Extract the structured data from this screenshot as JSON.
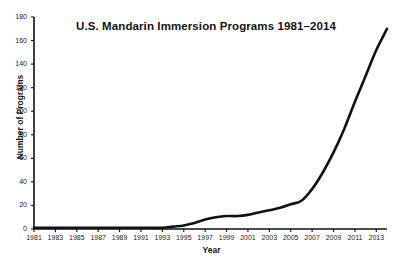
{
  "chart_data": {
    "type": "line",
    "title": "U.S. Mandarin Immersion Programs 1981–2014",
    "xlabel": "Year",
    "ylabel": "Number of Programs",
    "xlim": [
      1981,
      2014
    ],
    "ylim": [
      0,
      180
    ],
    "grid": false,
    "legend": null,
    "line_color": "#111111",
    "x_ticks": [
      1981,
      1983,
      1985,
      1987,
      1989,
      1991,
      1993,
      1995,
      1997,
      1999,
      2001,
      2003,
      2005,
      2007,
      2009,
      2011,
      2013
    ],
    "y_ticks": [
      0,
      20,
      40,
      60,
      80,
      100,
      120,
      140,
      160,
      180
    ],
    "x": [
      1981,
      1982,
      1983,
      1984,
      1985,
      1986,
      1987,
      1988,
      1989,
      1990,
      1991,
      1992,
      1993,
      1994,
      1995,
      1996,
      1997,
      1998,
      1999,
      2000,
      2001,
      2002,
      2003,
      2004,
      2005,
      2006,
      2007,
      2008,
      2009,
      2010,
      2011,
      2012,
      2013,
      2014
    ],
    "values": [
      1,
      1,
      1,
      1,
      1,
      1,
      1,
      1,
      1,
      1,
      1,
      1,
      1,
      2,
      3,
      5,
      8,
      10,
      11,
      11,
      12,
      14,
      16,
      18,
      21,
      24,
      34,
      48,
      65,
      85,
      108,
      130,
      152,
      170
    ],
    "series": [
      {
        "name": "U.S. Mandarin Immersion Programs",
        "values": [
          1,
          1,
          1,
          1,
          1,
          1,
          1,
          1,
          1,
          1,
          1,
          1,
          1,
          2,
          3,
          5,
          8,
          10,
          11,
          11,
          12,
          14,
          16,
          18,
          21,
          24,
          34,
          48,
          65,
          85,
          108,
          130,
          152,
          170
        ]
      }
    ]
  },
  "axes": {
    "y_tick_labels": [
      "180",
      "160",
      "140",
      "120",
      "100",
      "80",
      "60",
      "40",
      "20",
      "0"
    ],
    "x_tick_labels": [
      "1981",
      "1983",
      "1985",
      "1987",
      "1989",
      "1991",
      "1993",
      "1995",
      "1997",
      "1999",
      "2001",
      "2003",
      "2005",
      "2007",
      "2009",
      "2011",
      "2013"
    ]
  }
}
